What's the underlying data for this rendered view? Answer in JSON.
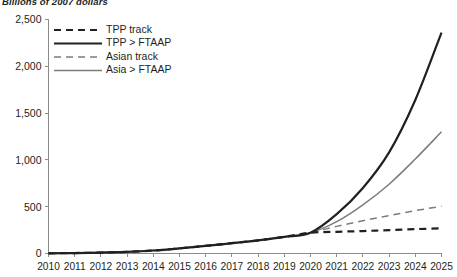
{
  "chart_data": {
    "type": "line",
    "title": "",
    "subtitle": "Billions of 2007 dollars",
    "xlabel": "",
    "ylabel": "",
    "xlim": [
      2010,
      2025
    ],
    "ylim": [
      0,
      2500
    ],
    "yticks": [
      0,
      500,
      1000,
      1500,
      2000,
      2500
    ],
    "ytick_labels": [
      "0",
      "500",
      "1,000",
      "1,500",
      "2,000",
      "2,500"
    ],
    "x": [
      2010,
      2011,
      2012,
      2013,
      2014,
      2015,
      2016,
      2017,
      2018,
      2019,
      2020,
      2021,
      2022,
      2023,
      2024,
      2025
    ],
    "xtick_labels": [
      "2010",
      "2011",
      "2012",
      "2013",
      "2014",
      "2015",
      "2016",
      "2017",
      "2018",
      "2019",
      "2020",
      "2021",
      "2022",
      "2023",
      "2024",
      "2025"
    ],
    "grid": false,
    "legend_position": "upper-left",
    "series": [
      {
        "name": "TPP track",
        "style": "dashed",
        "color": "#231f20",
        "width": 2.2,
        "dash": "7,5",
        "values": [
          2,
          5,
          10,
          18,
          32,
          55,
          82,
          110,
          140,
          178,
          222,
          232,
          240,
          250,
          260,
          270
        ]
      },
      {
        "name": "TPP > FTAAP",
        "style": "solid",
        "color": "#231f20",
        "width": 2.2,
        "dash": "",
        "values": [
          2,
          5,
          10,
          18,
          32,
          55,
          82,
          110,
          140,
          178,
          222,
          420,
          700,
          1080,
          1640,
          2360
        ]
      },
      {
        "name": "Asian track",
        "style": "dashed",
        "color": "#7c7c7c",
        "width": 1.5,
        "dash": "7,5",
        "values": [
          2,
          5,
          10,
          18,
          32,
          55,
          82,
          110,
          140,
          178,
          222,
          290,
          350,
          405,
          458,
          505
        ]
      },
      {
        "name": "Asia > FTAAP",
        "style": "solid",
        "color": "#7c7c7c",
        "width": 1.5,
        "dash": "",
        "values": [
          2,
          5,
          10,
          18,
          32,
          55,
          82,
          110,
          140,
          178,
          222,
          340,
          520,
          740,
          1010,
          1300
        ]
      }
    ],
    "legend": [
      {
        "label": "TPP track",
        "style": "dashed",
        "color": "#231f20",
        "width": 2.2,
        "dash": "7,5"
      },
      {
        "label": "TPP > FTAAP",
        "style": "solid",
        "color": "#231f20",
        "width": 2.2,
        "dash": ""
      },
      {
        "label": "Asian track",
        "style": "dashed",
        "color": "#7c7c7c",
        "width": 1.5,
        "dash": "7,5"
      },
      {
        "label": "Asia > FTAAP",
        "style": "solid",
        "color": "#7c7c7c",
        "width": 1.5,
        "dash": ""
      }
    ],
    "colors": {
      "dark": "#231f20",
      "gray": "#7c7c7c",
      "axis": "#8c8c8c",
      "background": "#ffffff"
    }
  }
}
